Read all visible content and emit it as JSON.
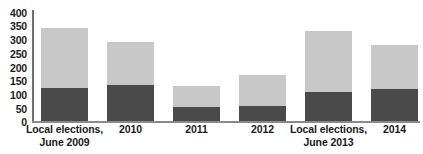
{
  "chart_data": {
    "type": "bar",
    "stacked": true,
    "title": "",
    "subtitle": "",
    "xlabel": "",
    "ylabel": "",
    "ylim": [
      0,
      400
    ],
    "ytick_values": [
      400,
      350,
      300,
      250,
      200,
      150,
      100,
      50,
      0
    ],
    "ytick_labels": [
      "400",
      "350",
      "300",
      "250",
      "200",
      "150",
      "100",
      "50",
      "0"
    ],
    "grid": false,
    "legend": "none",
    "categories": [
      "Local elections, June 2009",
      "2010",
      "2011",
      "2012",
      "Local elections, June 2013",
      "2014"
    ],
    "category_lines": [
      [
        "Local elections,",
        "June 2009"
      ],
      [
        "2010",
        ""
      ],
      [
        "2011",
        ""
      ],
      [
        "2012",
        ""
      ],
      [
        "Local elections,",
        "June 2013"
      ],
      [
        "2014",
        ""
      ]
    ],
    "series": [
      {
        "name": "lower-segment",
        "color": "#4a4a4a",
        "values": [
          120,
          128,
          51,
          55,
          106,
          117
        ]
      },
      {
        "name": "upper-segment",
        "color": "#c8c8c8",
        "values": [
          217,
          155,
          77,
          110,
          217,
          158
        ]
      }
    ],
    "totals": [
      337,
      283,
      128,
      165,
      323,
      275
    ],
    "colors": {
      "lower": "#4a4a4a",
      "upper": "#c8c8c8",
      "axis": "#6e6e6e",
      "text": "#1a1a1a",
      "background": "#ffffff"
    }
  }
}
